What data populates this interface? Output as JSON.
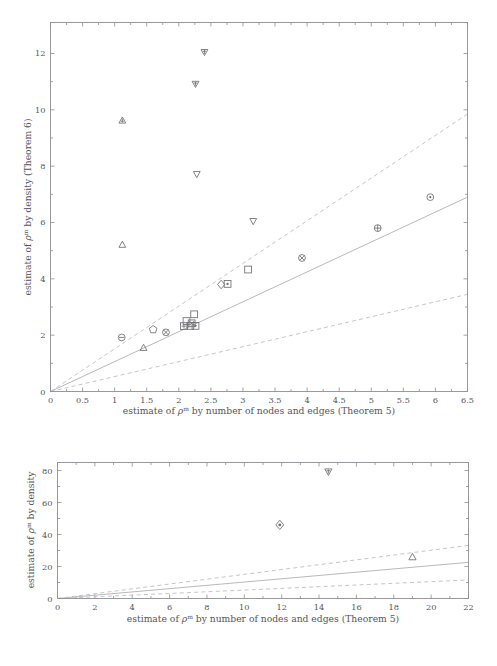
{
  "figure": {
    "title": "",
    "panels": [
      "top",
      "bottom"
    ]
  },
  "top": {
    "xlabel": "estimate of ρᵐ by number of nodes and edges (Theorem 5)",
    "ylabel": "estimate of ρᵐ by density (Theorem 6)",
    "xticks": [
      "0",
      "0.5",
      "1",
      "1.5",
      "2",
      "2.5",
      "3",
      "3.5",
      "4",
      "4.5",
      "5",
      "5.5",
      "6",
      "6.5"
    ],
    "yticks": [
      "0",
      "2",
      "4",
      "6",
      "8",
      "10",
      "12"
    ]
  },
  "bottom": {
    "xlabel": "estimate of ρᵐ by number of nodes and edges (Theorem 5)",
    "ylabel": "estimate of ρᵐ by density",
    "xticks": [
      "0",
      "2",
      "4",
      "6",
      "8",
      "10",
      "12",
      "14",
      "16",
      "18",
      "20",
      "22"
    ],
    "yticks": [
      "0",
      "20",
      "40",
      "60",
      "80"
    ]
  },
  "chart_data": [
    {
      "type": "scatter",
      "panel": "top",
      "title": "",
      "xlabel": "estimate of ρ^m by number of nodes and edges (Theorem 5)",
      "ylabel": "estimate of ρ^m by density (Theorem 6)",
      "xlim": [
        0,
        6.5
      ],
      "ylim": [
        0,
        13.1
      ],
      "xticks": [
        0,
        0.5,
        1,
        1.5,
        2,
        2.5,
        3,
        3.5,
        4,
        4.5,
        5,
        5.5,
        6,
        6.5
      ],
      "yticks": [
        0,
        2,
        4,
        6,
        8,
        10,
        12
      ],
      "grid": false,
      "legend": "none",
      "lines": [
        {
          "name": "identity-reference",
          "style": "solid",
          "points": [
            [
              0,
              0
            ],
            [
              6.5,
              6.9
            ]
          ]
        },
        {
          "name": "upper-bound",
          "style": "dashed",
          "points": [
            [
              0,
              0
            ],
            [
              6.5,
              9.85
            ]
          ]
        },
        {
          "name": "lower-bound",
          "style": "dashed",
          "points": [
            [
              0,
              0
            ],
            [
              6.5,
              3.45
            ]
          ]
        }
      ],
      "points": [
        {
          "x": 1.12,
          "y": 9.62,
          "marker": "triangle-up-filled"
        },
        {
          "x": 1.12,
          "y": 5.21,
          "marker": "triangle-up"
        },
        {
          "x": 1.11,
          "y": 1.92,
          "marker": "circle-minus"
        },
        {
          "x": 1.45,
          "y": 1.55,
          "marker": "triangle-up"
        },
        {
          "x": 1.6,
          "y": 2.2,
          "marker": "pentagon"
        },
        {
          "x": 1.8,
          "y": 2.1,
          "marker": "circle-x"
        },
        {
          "x": 2.08,
          "y": 2.32,
          "marker": "square-plus"
        },
        {
          "x": 2.12,
          "y": 2.5,
          "marker": "square"
        },
        {
          "x": 2.18,
          "y": 2.33,
          "marker": "square"
        },
        {
          "x": 2.2,
          "y": 2.42,
          "marker": "square-x"
        },
        {
          "x": 2.24,
          "y": 2.74,
          "marker": "square"
        },
        {
          "x": 2.26,
          "y": 2.33,
          "marker": "square-dot"
        },
        {
          "x": 2.26,
          "y": 10.92,
          "marker": "triangle-down-filled"
        },
        {
          "x": 2.28,
          "y": 7.72,
          "marker": "triangle-down"
        },
        {
          "x": 2.4,
          "y": 12.05,
          "marker": "triangle-down-filled"
        },
        {
          "x": 2.66,
          "y": 3.8,
          "marker": "diamond"
        },
        {
          "x": 2.76,
          "y": 3.82,
          "marker": "square-dot"
        },
        {
          "x": 3.08,
          "y": 4.33,
          "marker": "square"
        },
        {
          "x": 3.16,
          "y": 6.05,
          "marker": "triangle-down"
        },
        {
          "x": 3.92,
          "y": 4.74,
          "marker": "circle-x"
        },
        {
          "x": 5.1,
          "y": 5.8,
          "marker": "circle-plus"
        },
        {
          "x": 5.92,
          "y": 6.9,
          "marker": "circle-dot"
        }
      ]
    },
    {
      "type": "scatter",
      "panel": "bottom",
      "title": "",
      "xlabel": "estimate of ρ^m by number of nodes and edges (Theorem 5)",
      "ylabel": "estimate of ρ^m by density",
      "xlim": [
        0,
        22
      ],
      "ylim": [
        0,
        85
      ],
      "xticks": [
        0,
        2,
        4,
        6,
        8,
        10,
        12,
        14,
        16,
        18,
        20,
        22
      ],
      "yticks": [
        0,
        20,
        40,
        60,
        80
      ],
      "grid": false,
      "legend": "none",
      "lines": [
        {
          "name": "identity-reference",
          "style": "solid",
          "points": [
            [
              0,
              0
            ],
            [
              22,
              22.6
            ]
          ]
        },
        {
          "name": "upper-bound",
          "style": "dashed",
          "points": [
            [
              0,
              0
            ],
            [
              22,
              33.2
            ]
          ]
        },
        {
          "name": "lower-bound",
          "style": "dashed",
          "points": [
            [
              0,
              0
            ],
            [
              22,
              11.6
            ]
          ]
        }
      ],
      "points": [
        {
          "x": 14.5,
          "y": 79.3,
          "marker": "triangle-down-filled"
        },
        {
          "x": 11.9,
          "y": 46.0,
          "marker": "diamond-dot"
        },
        {
          "x": 19.0,
          "y": 25.9,
          "marker": "triangle-up"
        }
      ]
    }
  ],
  "colors": {
    "axis": "#8e8e93",
    "marker": "#6e6e73",
    "reference_line": "#b9b9be",
    "bound_line": "#c2c2c7",
    "text": "#55555a",
    "background": "#ffffff"
  }
}
